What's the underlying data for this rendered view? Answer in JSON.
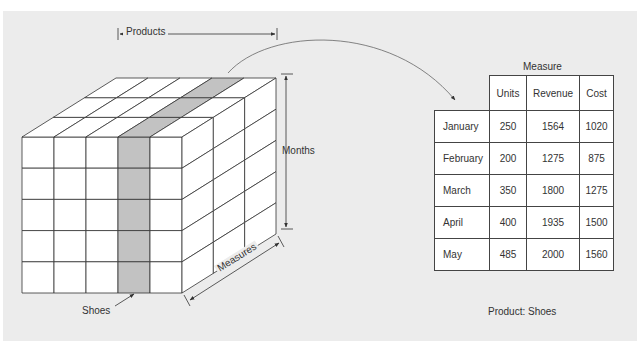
{
  "diagram": {
    "type": "olap-data-cube",
    "colors": {
      "background": "#ececec",
      "cell_fill": "#ffffff",
      "highlight_fill": "#c2c2c2",
      "line": "#333333",
      "arrow": "#666666"
    },
    "cube": {
      "columns": 5,
      "rows": 5,
      "depth": 3,
      "highlighted_column_index": 3,
      "axis_labels": {
        "products": "Products",
        "months": "Months",
        "measures": "Measures"
      },
      "callout": "Shoes"
    },
    "table": {
      "group_header": "Measure",
      "columns": [
        "Units",
        "Revenue",
        "Cost"
      ],
      "rows": [
        {
          "month": "January",
          "units": "250",
          "revenue": "1564",
          "cost": "1020"
        },
        {
          "month": "February",
          "units": "200",
          "revenue": "1275",
          "cost": "875"
        },
        {
          "month": "March",
          "units": "350",
          "revenue": "1800",
          "cost": "1275"
        },
        {
          "month": "April",
          "units": "400",
          "revenue": "1935",
          "cost": "1500"
        },
        {
          "month": "May",
          "units": "485",
          "revenue": "2000",
          "cost": "1560"
        }
      ],
      "caption": "Product: Shoes"
    }
  }
}
